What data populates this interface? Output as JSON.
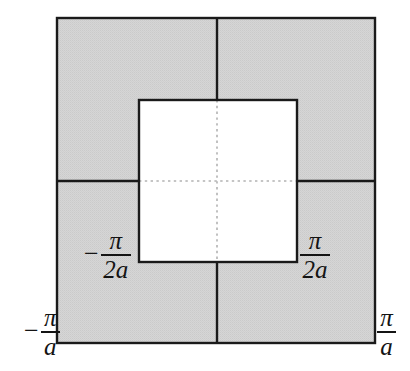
{
  "figure": {
    "colors": {
      "shaded_fill": "#d2d2d2",
      "unshaded_fill": "#ffffff",
      "solid_line": "#1a1a1a",
      "dotted_line": "#b0b0b0",
      "label_text": "#141414",
      "page_background": "#ffffff"
    },
    "geometry": {
      "outer_square": {
        "x": 57,
        "y": 18,
        "width": 318,
        "height": 325
      },
      "inner_square": {
        "x": 139,
        "y": 100,
        "width": 158,
        "height": 162
      },
      "center": {
        "x": 217,
        "y": 181
      }
    }
  },
  "labels": {
    "bottom_left": {
      "name": "neg-pi-over-a",
      "sign": "−",
      "numerator": "π",
      "denominator": "a",
      "text": "−π/a"
    },
    "bottom_right": {
      "name": "pi-over-a",
      "sign": "",
      "numerator": "π",
      "denominator": "a",
      "text": "π/a"
    },
    "inner_left": {
      "name": "neg-pi-over-2a",
      "sign": "−",
      "numerator": "π",
      "denominator": "2a",
      "text": "−π/2a"
    },
    "inner_right": {
      "name": "pi-over-2a",
      "sign": "",
      "numerator": "π",
      "denominator": "2a",
      "text": "π/2a"
    }
  }
}
